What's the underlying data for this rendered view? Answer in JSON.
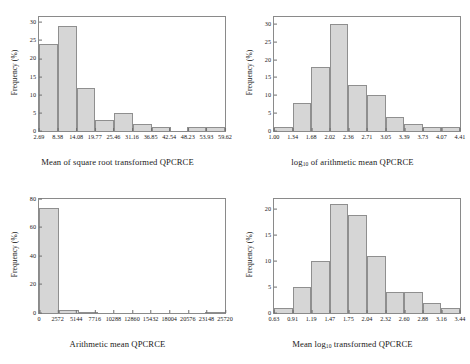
{
  "figure": {
    "background": "#ffffff",
    "bar_fill": "#d6d6d6",
    "bar_edge": "#8f8f8f",
    "axis_color": "#8a8a8a"
  },
  "chart_data": [
    {
      "id": "panel-top-left",
      "type": "bar",
      "title": "",
      "xlabel": "Mean of square root transformed QPCRCE",
      "ylabel": "Frequency (%)",
      "xlabel_parts": {
        "pre": "Mean of square root transformed QPCRCE",
        "sub": "",
        "post": ""
      },
      "categories": [
        "2.69",
        "8.38",
        "14.08",
        "19.77",
        "25.46",
        "31.16",
        "36.85",
        "42.54",
        "48.23",
        "53.93",
        "59.62"
      ],
      "values": [
        24,
        29,
        12,
        3,
        5,
        2,
        1,
        0,
        1,
        1
      ],
      "ytick_labels": [
        "0",
        "5",
        "10",
        "15",
        "20",
        "25",
        "30"
      ],
      "ytick_values": [
        0,
        5,
        10,
        15,
        20,
        25,
        30
      ],
      "ylim": [
        0,
        31.5
      ],
      "grid": false,
      "legend": "none"
    },
    {
      "id": "panel-top-right",
      "type": "bar",
      "title": "",
      "xlabel": "log10 of arithmetic mean QPCRCE",
      "ylabel": "Frequency (%)",
      "xlabel_parts": {
        "pre": "log",
        "sub": "10",
        "post": " of arithmetic mean QPCRCE"
      },
      "categories": [
        "1.00",
        "1.34",
        "1.68",
        "2.02",
        "2.36",
        "2.71",
        "3.05",
        "3.39",
        "3.73",
        "4.07",
        "4.41"
      ],
      "values": [
        1,
        8,
        18,
        30,
        13,
        10,
        4,
        2,
        1,
        1
      ],
      "ytick_labels": [
        "0",
        "5",
        "10",
        "15",
        "20",
        "25",
        "30"
      ],
      "ytick_values": [
        0,
        5,
        10,
        15,
        20,
        25,
        30
      ],
      "ylim": [
        0,
        32
      ],
      "grid": false,
      "legend": "none"
    },
    {
      "id": "panel-bottom-left",
      "type": "bar",
      "title": "",
      "xlabel": "Arithmetic mean QPCRCE",
      "ylabel": "Frequency (%)",
      "xlabel_parts": {
        "pre": "Arithmetic mean QPCRCE",
        "sub": "",
        "post": ""
      },
      "categories": [
        "0",
        "2572",
        "5144",
        "7716",
        "10288",
        "12860",
        "15432",
        "18004",
        "20576",
        "23148",
        "25720"
      ],
      "values": [
        74,
        2,
        1,
        0,
        0,
        0,
        0,
        0,
        0,
        1
      ],
      "ytick_labels": [
        "0",
        "20",
        "40",
        "60",
        "80"
      ],
      "ytick_values": [
        0,
        20,
        40,
        60,
        80
      ],
      "ylim": [
        0,
        80
      ],
      "grid": false,
      "legend": "none"
    },
    {
      "id": "panel-bottom-right",
      "type": "bar",
      "title": "",
      "xlabel": "Mean log10 transformed QPCRCE",
      "ylabel": "Frequency (%)",
      "xlabel_parts": {
        "pre": "Mean log",
        "sub": "10",
        "post": " transformed QPCRCE"
      },
      "categories": [
        "0.63",
        "0.91",
        "1.19",
        "1.47",
        "1.75",
        "2.04",
        "2.32",
        "2.60",
        "2.88",
        "3.16",
        "3.44"
      ],
      "values": [
        1,
        5,
        10,
        21,
        19,
        11,
        4,
        4,
        2,
        1
      ],
      "ytick_labels": [
        "0",
        "5",
        "10",
        "15",
        "20"
      ],
      "ytick_values": [
        0,
        5,
        10,
        15,
        20
      ],
      "ylim": [
        0,
        22
      ],
      "grid": false,
      "legend": "none"
    }
  ]
}
